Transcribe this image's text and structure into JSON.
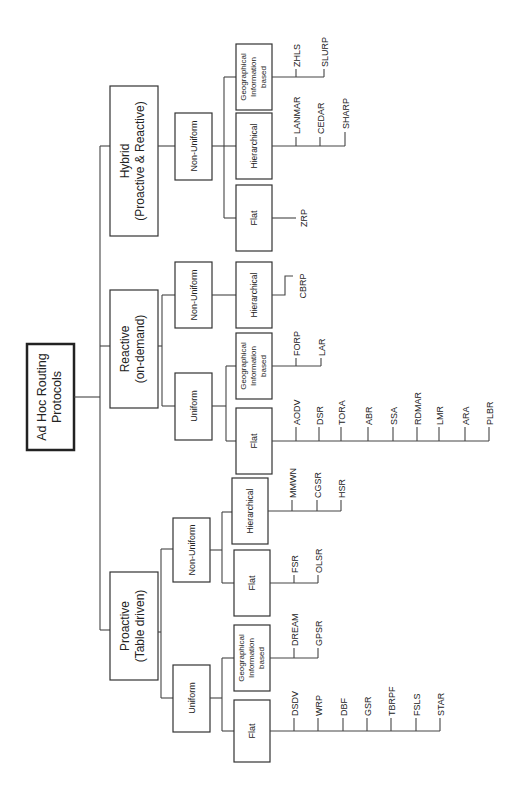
{
  "diagram": {
    "root": {
      "line1": "Ad Hoc Routing",
      "line2": "Protocols"
    },
    "categories": [
      {
        "line1": "Hybrid",
        "line2": "(Proactive & Reactive)",
        "groups": [
          {
            "label": "Non-Uniform",
            "subgroups": [
              {
                "label_lines": [
                  "Geographical",
                  "Information",
                  "based"
                ],
                "protocols": [
                  "ZHLS",
                  "SLURP"
                ]
              },
              {
                "label_lines": [
                  "Hierarchical"
                ],
                "protocols": [
                  "LANMAR",
                  "CEDAR",
                  "SHARP"
                ]
              },
              {
                "label_lines": [
                  "Flat"
                ],
                "protocols": [
                  "ZRP"
                ]
              }
            ]
          }
        ]
      },
      {
        "line1": "Reactive",
        "line2": "(on-demand)",
        "groups": [
          {
            "label": "Non-Uniform",
            "subgroups": [
              {
                "label_lines": [
                  "Hierarchical"
                ],
                "protocols": [
                  "CBRP"
                ]
              }
            ]
          },
          {
            "label": "Uniform",
            "subgroups": [
              {
                "label_lines": [
                  "Geographical",
                  "Information",
                  "based"
                ],
                "protocols": [
                  "FORP",
                  "LAR"
                ]
              },
              {
                "label_lines": [
                  "Flat"
                ],
                "protocols": [
                  "AODV",
                  "DSR",
                  "TORA",
                  "ABR",
                  "SSA",
                  "RDMAR",
                  "LMR",
                  "ARA",
                  "PLBR"
                ]
              }
            ]
          }
        ]
      },
      {
        "line1": "Proactive",
        "line2": "(Table driven)",
        "groups": [
          {
            "label": "Non-Uniform",
            "subgroups": [
              {
                "label_lines": [
                  "Hierarchical"
                ],
                "protocols": [
                  "MMWN",
                  "CGSR",
                  "HSR"
                ]
              },
              {
                "label_lines": [
                  "Flat"
                ],
                "protocols": [
                  "FSR",
                  "OLSR"
                ]
              }
            ]
          },
          {
            "label": "Uniform",
            "subgroups": [
              {
                "label_lines": [
                  "Geographical",
                  "Information",
                  "based"
                ],
                "protocols": [
                  "DREAM",
                  "GPSR"
                ]
              },
              {
                "label_lines": [
                  "Flat"
                ],
                "protocols": [
                  "DSDV",
                  "WRP",
                  "DBF",
                  "GSR",
                  "TBRPF",
                  "FSLS",
                  "STAR"
                ]
              }
            ]
          }
        ]
      }
    ]
  }
}
